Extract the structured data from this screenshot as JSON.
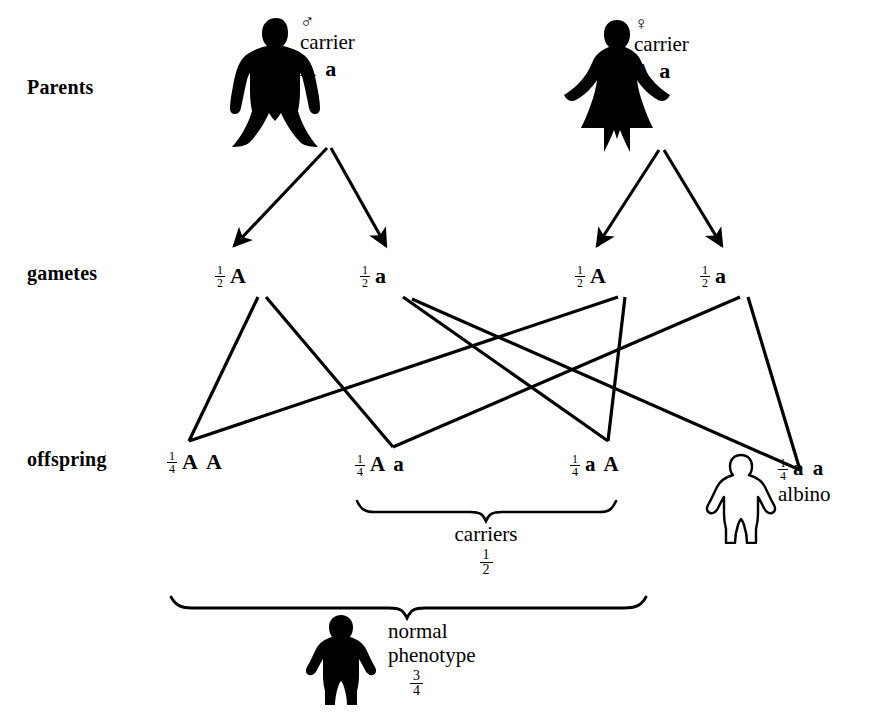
{
  "diagram": {
    "ink_color": "#000000",
    "background_color": "#ffffff"
  },
  "rows": {
    "parents_label": "Parents",
    "gametes_label": "gametes",
    "offspring_label": "offspring"
  },
  "parents": [
    {
      "figure": "male-silhouette",
      "sex_symbol": "♂",
      "status": "carrier",
      "genotype": "A a"
    },
    {
      "figure": "female-silhouette",
      "sex_symbol": "♀",
      "status": "carrier",
      "genotype": "A a"
    }
  ],
  "gametes": [
    {
      "fraction_num": "1",
      "fraction_den": "2",
      "allele": "A",
      "parent": "father"
    },
    {
      "fraction_num": "1",
      "fraction_den": "2",
      "allele": "a",
      "parent": "father"
    },
    {
      "fraction_num": "1",
      "fraction_den": "2",
      "allele": "A",
      "parent": "mother"
    },
    {
      "fraction_num": "1",
      "fraction_den": "2",
      "allele": "a",
      "parent": "mother"
    }
  ],
  "offspring": [
    {
      "fraction_num": "1",
      "fraction_den": "4",
      "genotype": "A A",
      "note": ""
    },
    {
      "fraction_num": "1",
      "fraction_den": "4",
      "genotype": "A a",
      "note": ""
    },
    {
      "fraction_num": "1",
      "fraction_den": "4",
      "genotype": "a A",
      "note": ""
    },
    {
      "fraction_num": "1",
      "fraction_den": "4",
      "genotype": "a a",
      "note": "albino"
    }
  ],
  "albino_figure": {
    "figure": "child-outline-silhouette",
    "label": "albino"
  },
  "brackets": {
    "carriers": {
      "label": "carriers",
      "fraction_num": "1",
      "fraction_den": "2"
    },
    "normal": {
      "label_line1": "normal",
      "label_line2": "phenotype",
      "fraction_num": "3",
      "fraction_den": "4",
      "figure": "child-filled-silhouette"
    }
  }
}
